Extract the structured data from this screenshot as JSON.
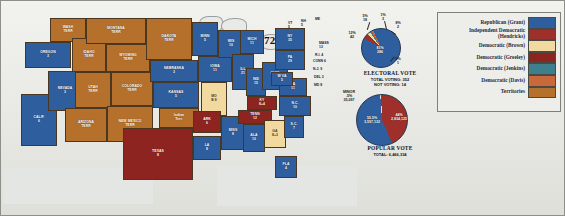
{
  "map": {
    "title": "1872",
    "states": [
      {
        "name": "WASH\nTERR",
        "ev": "",
        "cls": "terr",
        "x": 47,
        "y": 2,
        "w": 36,
        "h": 24
      },
      {
        "name": "OREGON",
        "ev": "3",
        "cls": "rep",
        "x": 22,
        "y": 26,
        "w": 46,
        "h": 26
      },
      {
        "name": "CALIF.",
        "ev": "6",
        "cls": "rep",
        "x": 18,
        "y": 78,
        "w": 36,
        "h": 52
      },
      {
        "name": "NEVADA",
        "ev": "3",
        "cls": "rep",
        "x": 45,
        "y": 55,
        "w": 34,
        "h": 40
      },
      {
        "name": "IDAHO\nTERR",
        "ev": "",
        "cls": "terr",
        "x": 69,
        "y": 22,
        "w": 34,
        "h": 34
      },
      {
        "name": "MONTANA\nTERR",
        "ev": "",
        "cls": "terr",
        "x": 83,
        "y": 2,
        "w": 60,
        "h": 26
      },
      {
        "name": "WYOMING\nTERR",
        "ev": "",
        "cls": "terr",
        "x": 103,
        "y": 28,
        "w": 44,
        "h": 28
      },
      {
        "name": "UTAH\nTERR",
        "ev": "",
        "cls": "terr",
        "x": 72,
        "y": 56,
        "w": 36,
        "h": 36
      },
      {
        "name": "COLORADO\nTERR",
        "ev": "",
        "cls": "terr",
        "x": 108,
        "y": 56,
        "w": 42,
        "h": 34
      },
      {
        "name": "ARIZONA\nTERR",
        "ev": "",
        "cls": "terr",
        "x": 62,
        "y": 92,
        "w": 42,
        "h": 34
      },
      {
        "name": "NEW MEXICO\nTERR",
        "ev": "",
        "cls": "terr",
        "x": 104,
        "y": 90,
        "w": 46,
        "h": 36
      },
      {
        "name": "DAKOTA\nTERR",
        "ev": "",
        "cls": "terr",
        "x": 143,
        "y": 2,
        "w": 46,
        "h": 42
      },
      {
        "name": "NEBRASKA",
        "ev": "3",
        "cls": "rep",
        "x": 147,
        "y": 44,
        "w": 48,
        "h": 22
      },
      {
        "name": "KANSAS",
        "ev": "5",
        "cls": "rep",
        "x": 150,
        "y": 66,
        "w": 46,
        "h": 26
      },
      {
        "name": "Indian\nTerr.",
        "ev": "",
        "cls": "terr",
        "x": 156,
        "y": 92,
        "w": 40,
        "h": 20
      },
      {
        "name": "TEXAS",
        "ev": "8",
        "cls": "greeley",
        "x": 120,
        "y": 112,
        "w": 70,
        "h": 52
      },
      {
        "name": "MINN",
        "ev": "5",
        "cls": "rep",
        "x": 189,
        "y": 6,
        "w": 26,
        "h": 34
      },
      {
        "name": "IOWA",
        "ev": "11",
        "cls": "rep",
        "x": 195,
        "y": 40,
        "w": 34,
        "h": 26
      },
      {
        "name": "WIS",
        "ev": "10",
        "cls": "rep",
        "x": 215,
        "y": 14,
        "w": 26,
        "h": 28
      },
      {
        "name": "MO",
        "ev": "B 8",
        "cls": "brown",
        "x": 198,
        "y": 66,
        "w": 26,
        "h": 34
      },
      {
        "name": "ARK",
        "ev": "6",
        "cls": "greeley",
        "x": 190,
        "y": 95,
        "w": 28,
        "h": 22
      },
      {
        "name": "LA",
        "ev": "8",
        "cls": "rep",
        "x": 190,
        "y": 120,
        "w": 28,
        "h": 24
      },
      {
        "name": "MISS",
        "ev": "8",
        "cls": "rep",
        "x": 218,
        "y": 100,
        "w": 24,
        "h": 34
      },
      {
        "name": "ILL",
        "ev": "21",
        "cls": "rep",
        "x": 229,
        "y": 38,
        "w": 22,
        "h": 36
      },
      {
        "name": "IND",
        "ev": "15",
        "cls": "rep",
        "x": 243,
        "y": 52,
        "w": 20,
        "h": 28
      },
      {
        "name": "OHIO",
        "ev": "22",
        "cls": "rep",
        "x": 259,
        "y": 46,
        "w": 26,
        "h": 28
      },
      {
        "name": "MICH",
        "ev": "11",
        "cls": "rep",
        "x": 237,
        "y": 14,
        "w": 24,
        "h": 24
      },
      {
        "name": "KY",
        "ev": "8+4",
        "cls": "greeley",
        "x": 244,
        "y": 80,
        "w": 30,
        "h": 14
      },
      {
        "name": "TENN",
        "ev": "12",
        "cls": "greeley",
        "x": 235,
        "y": 94,
        "w": 34,
        "h": 14
      },
      {
        "name": "ALA",
        "ev": "10",
        "cls": "rep",
        "x": 240,
        "y": 108,
        "w": 22,
        "h": 28
      },
      {
        "name": "GA",
        "ev": "8+3",
        "cls": "brown",
        "x": 261,
        "y": 104,
        "w": 22,
        "h": 28
      },
      {
        "name": "FLA",
        "ev": "4",
        "cls": "rep",
        "x": 272,
        "y": 140,
        "w": 22,
        "h": 22
      },
      {
        "name": "S.C.",
        "ev": "7",
        "cls": "rep",
        "x": 281,
        "y": 100,
        "w": 20,
        "h": 22
      },
      {
        "name": "N.C.",
        "ev": "10",
        "cls": "rep",
        "x": 276,
        "y": 80,
        "w": 32,
        "h": 20
      },
      {
        "name": "VA",
        "ev": "11",
        "cls": "rep",
        "x": 276,
        "y": 62,
        "w": 28,
        "h": 18
      },
      {
        "name": "W VA",
        "ev": "5",
        "cls": "rep",
        "x": 268,
        "y": 56,
        "w": 22,
        "h": 14
      },
      {
        "name": "PA",
        "ev": "29",
        "cls": "rep",
        "x": 272,
        "y": 34,
        "w": 30,
        "h": 20
      },
      {
        "name": "NY",
        "ev": "35",
        "cls": "rep",
        "x": 272,
        "y": 12,
        "w": 30,
        "h": 22
      }
    ],
    "small_labels": [
      {
        "text": "ME",
        "x": 312,
        "y": 2
      },
      {
        "text": "NH\n5",
        "x": 298,
        "y": 4
      },
      {
        "text": "VT\n5",
        "x": 285,
        "y": 6
      },
      {
        "text": "MASS\n13",
        "x": 316,
        "y": 26
      },
      {
        "text": "R.I. 4",
        "x": 312,
        "y": 38
      },
      {
        "text": "CONN 6",
        "x": 310,
        "y": 44
      },
      {
        "text": "N.J. 9",
        "x": 310,
        "y": 52
      },
      {
        "text": "DEL 3",
        "x": 311,
        "y": 60
      },
      {
        "text": "MD 8",
        "x": 311,
        "y": 68
      }
    ]
  },
  "electoral": {
    "chart_data": {
      "type": "pie",
      "title": "ELECTORAL VOTE",
      "labels": [
        "Grant",
        "Hendricks",
        "Brown",
        "Jenkins",
        "Davis"
      ],
      "values": [
        286,
        42,
        18,
        3,
        2,
        1
      ],
      "slices": [
        {
          "pct": "81%",
          "count": "286",
          "color": "#2f5e9e"
        },
        {
          "pct": "12%",
          "count": "42",
          "color": "#2f5e9e"
        },
        {
          "pct": "5%",
          "count": "18",
          "color": "#9e2f2b"
        },
        {
          "pct": "1%",
          "count": "3",
          "color": "#f2d9a0"
        },
        {
          "pct": "8%",
          "count": "2",
          "color": "#3f7f8c"
        },
        {
          "pct": "5%",
          "count": "1",
          "color": "#c9683a"
        }
      ],
      "total_voting": "TOTAL VOTING: 352",
      "not_voting": "NOT VOTING: 14"
    },
    "title": "ELECTORAL  VOTE",
    "total_line": "TOTAL VOTING: 352",
    "notvoting_line": "NOT VOTING: 14",
    "lab_81": "81%\n286",
    "lab_12": "12%\n42",
    "lab_5a": "5%\n18",
    "lab_1a": "1%\n3",
    "lab_8": "8%\n2",
    "lab_5b": "5%\n1"
  },
  "popular": {
    "chart_data": {
      "type": "pie",
      "title": "POPULAR VOTE",
      "labels": [
        "Grant",
        "Greeley",
        "Minor"
      ],
      "values": [
        3597132,
        2834125,
        35097
      ],
      "percents": [
        55.5,
        44.0,
        0.5
      ],
      "slices": [
        {
          "pct": "55.5%",
          "count": "3,597,132",
          "color": "#2f5e9e"
        },
        {
          "pct": "44%",
          "count": "2,834,125",
          "color": "#9e2f2b"
        },
        {
          "pct": ".5%",
          "count": "35,097",
          "color": "#e0e0dc"
        }
      ],
      "total": "TOTAL: 6,466,334"
    },
    "title": "POPULAR  VOTE",
    "total_line": "TOTAL: 6,466,334",
    "lab_minor": "MINOR\n.5%\n35,097",
    "lab_grant": "55.5%\n3,597,132",
    "lab_greeley": "44%\n2,834,125"
  },
  "legend": {
    "items": [
      {
        "label": "Republican (Grant)",
        "color": "#2f5e9e"
      },
      {
        "label": "Independent Democratic\n(Hendricks)",
        "color": "#9e2f2b"
      },
      {
        "label": "Democratic (Brown)",
        "color": "#f2d9a0"
      },
      {
        "label": "Democratic (Greeley)",
        "color": "#8e2420"
      },
      {
        "label": "Democratic (Jenkins)",
        "color": "#3f7f8c"
      },
      {
        "label": "Democratic (Davis)",
        "color": "#c9683a"
      },
      {
        "label": "Territories",
        "color": "#b5702c"
      }
    ]
  }
}
